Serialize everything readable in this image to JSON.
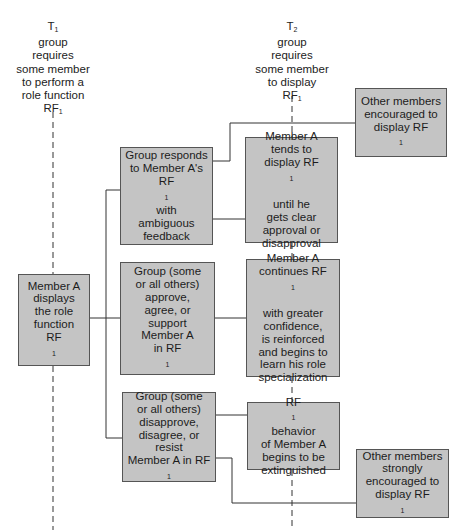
{
  "timepoints": {
    "t1": {
      "label": "T",
      "sub": "1",
      "lines": [
        "group",
        "requires",
        "some member",
        "to perform a",
        "role function"
      ],
      "rf": "RF",
      "rf_sub": "1"
    },
    "t2": {
      "label": "T",
      "sub": "2",
      "lines": [
        "group",
        "requires",
        "some member",
        "to display"
      ],
      "rf": "RF",
      "rf_sub": "1"
    }
  },
  "boxes": {
    "member_a_displays": {
      "pre": "Member A\ndisplays\nthe role\nfunction\nRF",
      "sub": "1",
      "post": ""
    },
    "group_ambiguous": {
      "pre": "Group responds\nto Member A's\nRF",
      "sub": "1",
      "post": " with\nambiguous\nfeedback"
    },
    "group_approve": {
      "pre": "Group (some\nor all others)\napprove,\nagree, or\nsupport\nMember A\nin RF",
      "sub": "1",
      "post": ""
    },
    "group_disapprove": {
      "pre": "Group (some\nor all others)\ndisapprove,\ndisagree, or resist\nMember A in RF",
      "sub": "1",
      "post": ""
    },
    "member_a_tends": {
      "pre": "Member A\ntends to\ndisplay RF",
      "sub": "1",
      "post": "\nuntil he\ngets clear\napproval or\ndisapproval"
    },
    "member_a_continues": {
      "pre": "Member A\ncontinues RF",
      "sub": "1",
      "post": "\nwith greater\nconfidence,\nis reinforced\nand begins to\nlearn his role\nspecialization"
    },
    "rf1_extinguished": {
      "pre": "RF",
      "sub": "1",
      "post": " behavior\nof Member A\nbegins to be\nextinguished"
    },
    "others_encouraged": {
      "pre": "Other members\nencouraged to\ndisplay RF",
      "sub": "1",
      "post": ""
    },
    "others_strongly_encouraged": {
      "pre": "Other members\nstrongly\nencouraged to\ndisplay RF",
      "sub": "1",
      "post": ""
    }
  },
  "colors": {
    "box_fill": "#c4c4c4",
    "box_border": "#555555",
    "line": "#333333"
  }
}
